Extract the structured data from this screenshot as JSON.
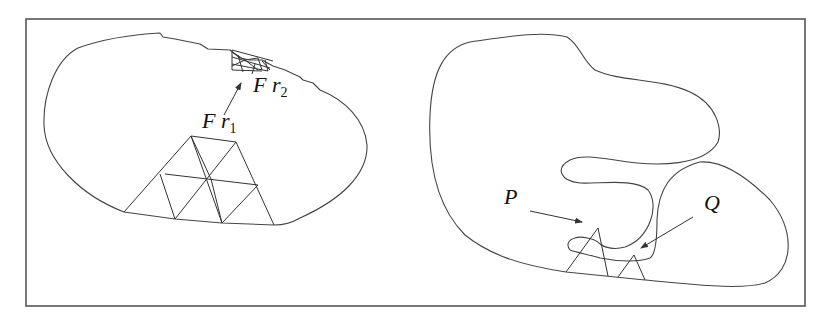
{
  "figure": {
    "left_panel": {
      "labels": {
        "fr1_main": "F r",
        "fr1_sub": "1",
        "fr2_main": "F r",
        "fr2_sub": "2"
      }
    },
    "right_panel": {
      "labels": {
        "p": "P",
        "q": "Q"
      }
    },
    "colors": {
      "line": "#444444",
      "background": "#ffffff"
    }
  }
}
